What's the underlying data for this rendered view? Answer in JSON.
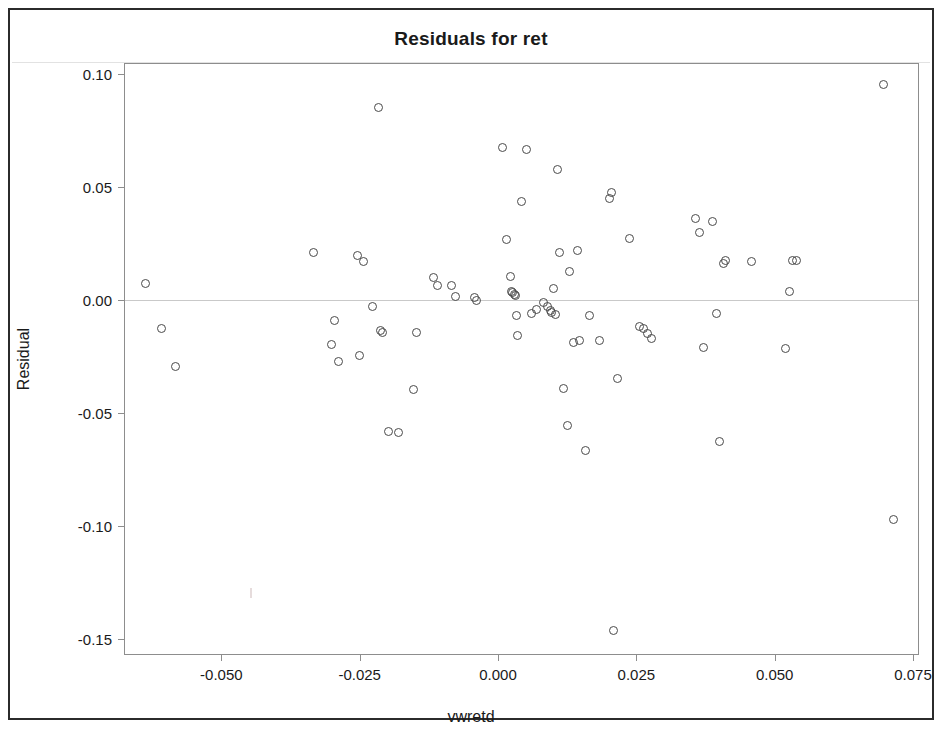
{
  "chart_data": {
    "type": "scatter",
    "title": "Residuals for ret",
    "xlabel": "vwretd",
    "ylabel": "Residual",
    "xlim": [
      -0.0674,
      0.0784
    ],
    "ylim": [
      -0.1576,
      0.1031
    ],
    "grid": false,
    "legend": null,
    "reference_line_y": 0.0,
    "marker": "open-circle",
    "marker_color": "#4a4a4a",
    "xticks": [
      -0.05,
      -0.025,
      0.0,
      0.025,
      0.05,
      0.075
    ],
    "xtick_labels": [
      "-0.050",
      "-0.025",
      "0.000",
      "0.025",
      "0.050",
      "0.075"
    ],
    "yticks": [
      0.1,
      0.05,
      0.0,
      -0.05,
      -0.1,
      -0.15
    ],
    "ytick_labels": [
      "0.10",
      "0.05",
      "0.00",
      "-0.05",
      "-0.10",
      "-0.15"
    ],
    "n_points": 72,
    "x": [
      -0.0637,
      -0.0608,
      -0.0582,
      -0.0333,
      -0.0301,
      -0.0296,
      -0.0289,
      -0.0254,
      -0.025,
      -0.0243,
      -0.0227,
      -0.0216,
      -0.0213,
      -0.0208,
      -0.0198,
      -0.018,
      -0.0152,
      -0.0148,
      -0.0116,
      -0.0109,
      -0.0084,
      -0.0076,
      -0.0043,
      -0.0038,
      0.0008,
      0.0015,
      0.0022,
      0.0024,
      0.0027,
      0.0029,
      0.0031,
      0.0033,
      0.0035,
      0.0042,
      0.0052,
      0.006,
      0.0069,
      0.0083,
      0.009,
      0.0094,
      0.0096,
      0.01,
      0.0104,
      0.0108,
      0.0112,
      0.0119,
      0.0126,
      0.013,
      0.0137,
      0.0144,
      0.0148,
      0.0159,
      0.0166,
      0.0184,
      0.0202,
      0.0206,
      0.0208,
      0.0216,
      0.0238,
      0.0256,
      0.0263,
      0.0271,
      0.0278,
      0.0357,
      0.0365,
      0.0372,
      0.0387,
      0.0394,
      0.0401,
      0.0408,
      0.0412,
      0.0459,
      0.0519,
      0.0526,
      0.0533,
      0.054,
      0.0696,
      0.0714
    ],
    "y": [
      0.0075,
      -0.0124,
      -0.0296,
      0.0212,
      -0.0199,
      -0.0092,
      -0.027,
      0.0196,
      -0.0244,
      0.0172,
      -0.0029,
      0.085,
      -0.0137,
      -0.0145,
      -0.058,
      -0.0585,
      -0.0397,
      -0.0145,
      0.0098,
      0.0065,
      0.0062,
      0.0014,
      0.0009,
      -0.0003,
      0.0676,
      0.0266,
      0.0103,
      0.0036,
      0.0031,
      0.0026,
      0.0021,
      -0.007,
      -0.0156,
      0.0434,
      0.0667,
      -0.0058,
      -0.0041,
      -0.0013,
      -0.003,
      -0.0048,
      -0.0056,
      0.0052,
      -0.0063,
      0.0579,
      0.021,
      -0.0393,
      -0.0556,
      0.0128,
      -0.019,
      0.0221,
      -0.0179,
      -0.0666,
      -0.0069,
      -0.0178,
      0.045,
      0.0476,
      -0.1463,
      -0.0347,
      0.027,
      -0.0116,
      -0.0126,
      -0.0148,
      -0.017,
      0.0362,
      0.0297,
      -0.0212,
      0.0346,
      -0.006,
      -0.0624,
      0.0163,
      0.0174,
      0.0171,
      -0.0215,
      0.0038,
      0.0173,
      0.0176,
      0.0955,
      -0.097
    ]
  }
}
